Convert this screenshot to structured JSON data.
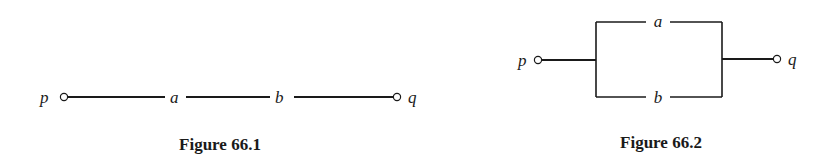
{
  "figures": [
    {
      "id": "66.1",
      "caption": "Figure 66.1",
      "type": "series",
      "terminals": {
        "left": "p",
        "right": "q"
      },
      "switches": [
        "a",
        "b"
      ]
    },
    {
      "id": "66.2",
      "caption": "Figure 66.2",
      "type": "parallel",
      "terminals": {
        "left": "p",
        "right": "q"
      },
      "switches": {
        "top": "a",
        "bottom": "b"
      }
    }
  ]
}
